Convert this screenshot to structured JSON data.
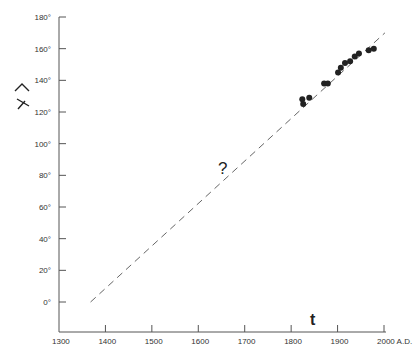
{
  "chart_data": {
    "type": "scatter",
    "title": "",
    "xlabel": "t",
    "ylabel": "angle (rotated λ̂ symbol)",
    "x_unit_label": "A.D.",
    "xlim": [
      1300,
      2000
    ],
    "ylim": [
      -15,
      180
    ],
    "x_ticks": [
      1300,
      1400,
      1500,
      1600,
      1700,
      1800,
      1900,
      2000
    ],
    "x_tick_labels": [
      "1300",
      "1400",
      "1500",
      "1600",
      "1700",
      "1800",
      "1900",
      "2000 A.D."
    ],
    "y_ticks": [
      0,
      20,
      40,
      60,
      80,
      100,
      120,
      140,
      160,
      180
    ],
    "y_tick_labels": [
      "0°",
      "20°",
      "40°",
      "60°",
      "80°",
      "100°",
      "120°",
      "140°",
      "160°",
      "180°"
    ],
    "grid": false,
    "legend": null,
    "series": [
      {
        "name": "observations",
        "style": "filled-circles",
        "x": [
          1824,
          1826,
          1839,
          1871,
          1879,
          1901,
          1907,
          1916,
          1927,
          1937,
          1946,
          1967,
          1978
        ],
        "y": [
          128,
          125,
          129,
          138,
          138,
          145,
          148,
          151,
          152,
          155,
          157,
          159,
          160
        ]
      },
      {
        "name": "linear extrapolation",
        "style": "dashed-line",
        "x": [
          1368,
          2002
        ],
        "y": [
          0,
          170
        ]
      }
    ],
    "annotations": [
      {
        "text": "?",
        "x": 1650,
        "y": 84
      },
      {
        "text": "t",
        "x": 1845,
        "y": -10
      }
    ]
  },
  "labels": {
    "question": "?",
    "time_symbol": "t"
  },
  "colors": {
    "ink": "#222222",
    "axis": "#555555",
    "dash": "#666666"
  }
}
